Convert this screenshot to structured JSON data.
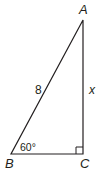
{
  "diagram": {
    "type": "right-triangle",
    "vertices": {
      "A": {
        "label": "A"
      },
      "B": {
        "label": "B"
      },
      "C": {
        "label": "C"
      }
    },
    "sides": {
      "hypotenuse_AB": {
        "label": "8"
      },
      "leg_AC": {
        "label": "x"
      }
    },
    "angles": {
      "B": {
        "label": "60°"
      },
      "C": {
        "right_angle": true
      }
    },
    "colors": {
      "stroke": "#231f20",
      "background": "#ffffff"
    }
  }
}
